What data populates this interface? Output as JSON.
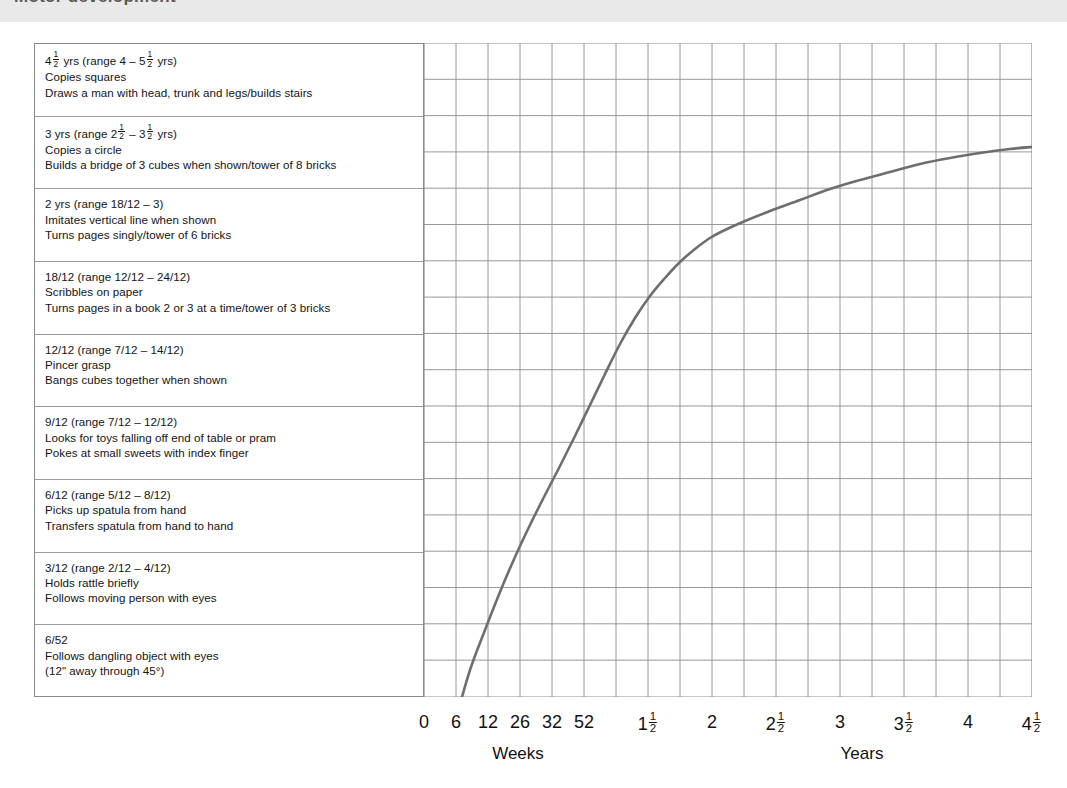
{
  "banner": {
    "cut_title": "Motor development"
  },
  "rows": [
    {
      "title_pre": "4",
      "title_frac": [
        "1",
        "2"
      ],
      "title_mid": " yrs (range 4 – 5",
      "title_frac2": [
        "1",
        "2"
      ],
      "title_post": " yrs)",
      "line1": "Copies squares",
      "line2": "Draws a man with head, trunk and legs/builds stairs"
    },
    {
      "title_pre": "3 yrs (range 2",
      "title_frac": [
        "1",
        "2"
      ],
      "title_mid": " – 3",
      "title_frac2": [
        "1",
        "2"
      ],
      "title_post": " yrs)",
      "line1": "Copies a circle",
      "line2": "Builds a bridge of 3 cubes when shown/tower of 8 bricks"
    },
    {
      "title": "2 yrs (range 18/12 – 3)",
      "line1": "Imitates vertical line when shown",
      "line2": "Turns pages singly/tower of 6 bricks"
    },
    {
      "title": "18/12 (range 12/12 – 24/12)",
      "line1": "Scribbles on paper",
      "line2": "Turns pages in a book 2 or 3 at a time/tower of 3 bricks"
    },
    {
      "title": "12/12 (range 7/12 – 14/12)",
      "line1": "Pincer grasp",
      "line2": "Bangs cubes together when shown"
    },
    {
      "title": "9/12 (range 7/12 – 12/12)",
      "line1": "Looks for toys falling off end of table or pram",
      "line2": "Pokes at small sweets with index finger"
    },
    {
      "title": "6/12 (range 5/12 – 8/12)",
      "line1": "Picks up spatula from hand",
      "line2": "Transfers spatula from hand to hand"
    },
    {
      "title": "3/12 (range 2/12 – 4/12)",
      "line1": "Holds rattle briefly",
      "line2": "Follows moving person with eyes"
    },
    {
      "title": "6/52",
      "line1": "Follows dangling object with eyes",
      "line2": "(12\" away through 45°)"
    }
  ],
  "chart_data": {
    "type": "line",
    "title": "",
    "xlabel": "",
    "ylabel": "",
    "grid": true,
    "legend": null,
    "axis_captions": [
      {
        "text": "Weeks",
        "x_px": 518
      },
      {
        "text": "Years",
        "x_px": 862
      }
    ],
    "x_ticks": [
      {
        "label": "0",
        "frac": null,
        "x_px": 424
      },
      {
        "label": "6",
        "frac": null,
        "x_px": 456
      },
      {
        "label": "12",
        "frac": null,
        "x_px": 488
      },
      {
        "label": "26",
        "frac": null,
        "x_px": 520
      },
      {
        "label": "32",
        "frac": null,
        "x_px": 552
      },
      {
        "label": "52",
        "frac": null,
        "x_px": 584
      },
      {
        "label": "1",
        "frac": [
          "1",
          "2"
        ],
        "x_px": 648
      },
      {
        "label": "2",
        "frac": null,
        "x_px": 712
      },
      {
        "label": "2",
        "frac": [
          "1",
          "2"
        ],
        "x_px": 776
      },
      {
        "label": "3",
        "frac": null,
        "x_px": 840
      },
      {
        "label": "3",
        "frac": [
          "1",
          "2"
        ],
        "x_px": 904
      },
      {
        "label": "4",
        "frac": null,
        "x_px": 968
      },
      {
        "label": "4",
        "frac": [
          "1",
          "2"
        ],
        "x_px": 1032
      }
    ],
    "y_categories": [
      "6/52",
      "3/12",
      "6/12",
      "9/12",
      "12/12",
      "18/12",
      "2 yrs",
      "3 yrs",
      "4½ yrs"
    ],
    "series": [
      {
        "name": "Developmental progress",
        "color": "#6e6e6e",
        "points": [
          [
            455,
            700
          ],
          [
            470,
            648
          ],
          [
            485,
            608
          ],
          [
            500,
            570
          ],
          [
            515,
            535
          ],
          [
            530,
            503
          ],
          [
            545,
            473
          ],
          [
            560,
            444
          ],
          [
            575,
            414
          ],
          [
            590,
            383
          ],
          [
            605,
            352
          ],
          [
            620,
            322
          ],
          [
            635,
            296
          ],
          [
            650,
            274
          ],
          [
            665,
            256
          ],
          [
            680,
            240
          ],
          [
            695,
            227
          ],
          [
            710,
            216
          ],
          [
            725,
            208
          ],
          [
            745,
            199
          ],
          [
            770,
            189
          ],
          [
            800,
            178
          ],
          [
            830,
            167
          ],
          [
            860,
            158
          ],
          [
            890,
            150
          ],
          [
            920,
            142
          ],
          [
            950,
            136
          ],
          [
            980,
            131
          ],
          [
            1010,
            127
          ],
          [
            1032,
            125
          ]
        ]
      }
    ],
    "grid_x_px": [
      424,
      456,
      488,
      520,
      552,
      584,
      616,
      648,
      680,
      712,
      744,
      776,
      808,
      840,
      872,
      904,
      936,
      968,
      1000,
      1032
    ],
    "grid_y_px": [
      21,
      57.3,
      93.6,
      129.9,
      166.2,
      202.5,
      238.8,
      275.1,
      311.4,
      347.7,
      384,
      420.3,
      456.6,
      492.9,
      529.2,
      565.5,
      601.8,
      638.1,
      675
    ],
    "colors": {
      "grid": "#8d8d8d",
      "curve": "#6e6e6e",
      "panel_border": "#8a8a8a",
      "banner": "#e9e9e9"
    }
  }
}
